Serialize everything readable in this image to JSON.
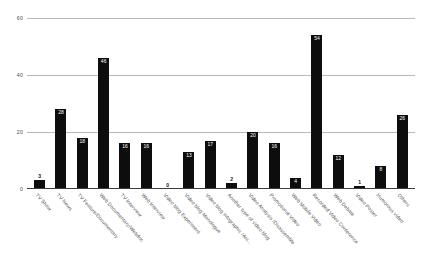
{
  "chart_data": {
    "type": "bar",
    "title": "",
    "xlabel": "",
    "ylabel": "",
    "ylim": [
      0,
      60
    ],
    "yticks": [
      0,
      20,
      40,
      60
    ],
    "grid": true,
    "legend": "none",
    "bar_color": "#0d0d0d",
    "gridline_color": "#b9b9b9",
    "categories": [
      "TV Show",
      "TV News",
      "TV Feature/Documentary",
      "Web Documentary/Webdoc",
      "TV Interview",
      "Web Interview",
      "Video blog Experiment",
      "Video blog Monologue",
      "Video blog infographic /Ani...",
      "Another type of video blog",
      "Video Analysis /Disassemble",
      "Promotional Video",
      "Web Mobile Video",
      "Recorded Video Conference",
      "Web Debate",
      "Video Poster",
      "Humorous video",
      "Others"
    ],
    "values": [
      3,
      28,
      18,
      46,
      16,
      16,
      0,
      13,
      17,
      2,
      20,
      16,
      4,
      54,
      12,
      1,
      8,
      26
    ]
  }
}
